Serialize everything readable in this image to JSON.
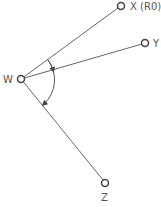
{
  "diagram": {
    "nodes": [
      {
        "id": "W",
        "label": "W",
        "x": 21,
        "y": 79
      },
      {
        "id": "X",
        "label": "X (R0)",
        "x": 121,
        "y": 6
      },
      {
        "id": "Y",
        "label": "Y",
        "x": 145,
        "y": 43
      },
      {
        "id": "Z",
        "label": "Z",
        "x": 105,
        "y": 183
      }
    ],
    "edges": [
      {
        "from": "W",
        "to": "X"
      },
      {
        "from": "W",
        "to": "Y"
      },
      {
        "from": "W",
        "to": "Z"
      }
    ],
    "angle_arcs": [
      {
        "from": "WX",
        "to": "WY",
        "direction": "clockwise"
      },
      {
        "from": "WX",
        "to": "WZ",
        "direction": "clockwise"
      }
    ],
    "colors": {
      "line": "#555555",
      "text": "#555555"
    }
  }
}
